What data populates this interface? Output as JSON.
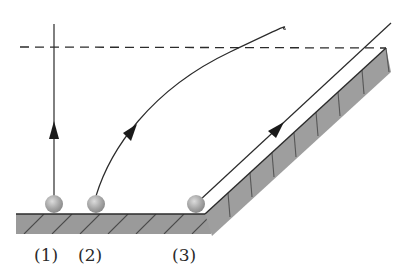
{
  "figure": {
    "colors": {
      "line": "#2b2b2b",
      "surface_fill": "#9a9a9a",
      "surface_hatch": "#4a4a4a",
      "ramp_top": "#ffffff",
      "ball_fill": "#a8a8a8",
      "ball_highlight": "#d6d6d6"
    },
    "labels": [
      {
        "id": "1",
        "text": "(1)"
      },
      {
        "id": "2",
        "text": "(2)"
      },
      {
        "id": "3",
        "text": "(3)"
      }
    ],
    "paths": [
      {
        "id": "1",
        "type": "vertical",
        "arrow": "up"
      },
      {
        "id": "2",
        "type": "curve",
        "arrow": "up-right"
      },
      {
        "id": "3",
        "type": "incline",
        "arrow": "up-right"
      }
    ],
    "reference_line": {
      "style": "dashed",
      "meaning": "equal height"
    }
  }
}
